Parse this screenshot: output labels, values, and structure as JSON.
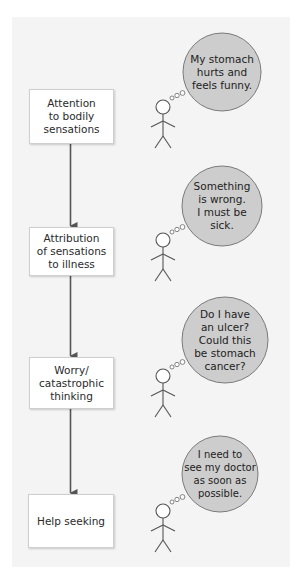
{
  "colors": {
    "panel_bg": "#f4f4f4",
    "box_bg": "#ffffff",
    "box_border": "#cfcfcf",
    "bubble_fill": "#cdcdcd",
    "bubble_stroke": "#7a7a7a",
    "arrow": "#555555",
    "figure_stroke": "#555555"
  },
  "steps": [
    {
      "label": "Attention\nto bodily\nsensations",
      "thought": "My stomach\nhurts and\nfeels funny."
    },
    {
      "label": "Attribution\nof sensations\nto illness",
      "thought": "Something\nis wrong.\nI must be\nsick."
    },
    {
      "label": "Worry/\ncatastrophic\nthinking",
      "thought": "Do I have\nan ulcer?\nCould this\nbe stomach\ncancer?"
    },
    {
      "label": "Help seeking",
      "thought": "I need to\nsee my doctor\nas soon as\npossible."
    }
  ],
  "icons": {
    "stick_figure": "stick-figure-icon",
    "thought_bubble": "thought-bubble-icon",
    "arrow": "arrow-down-icon"
  }
}
